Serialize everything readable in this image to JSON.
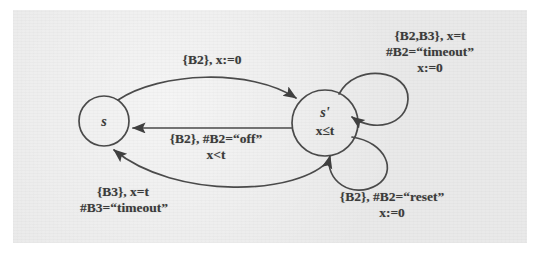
{
  "figure": {
    "kind": "timed-automaton-diagram",
    "background_color": "#e9e9e9",
    "page_color": "#ffffff",
    "ink_color": "#3b3b3b"
  },
  "states": [
    {
      "id": "s",
      "label": "s",
      "invariant": ""
    },
    {
      "id": "s2",
      "label": "s'",
      "invariant": "x≤t"
    }
  ],
  "transitions": [
    {
      "id": "t-s-to-sprime",
      "from": "s",
      "to": "s'",
      "shape": "arc-above",
      "label_lines": [
        "{B2}, x:=0"
      ]
    },
    {
      "id": "t-sprime-to-s-off",
      "from": "s'",
      "to": "s",
      "shape": "straight",
      "label_lines": [
        "{B2}, #B2=“off”",
        "x<t"
      ]
    },
    {
      "id": "t-sprime-to-s-timeout",
      "from": "s'",
      "to": "s",
      "shape": "arc-below",
      "label_lines": [
        "{B3}, x=t",
        "#B3=“timeout”"
      ]
    },
    {
      "id": "t-sprime-self-timeout",
      "from": "s'",
      "to": "s'",
      "shape": "self-loop-upper-right",
      "label_lines": [
        "{B2,B3}, x=t",
        "#B2=“timeout”",
        "x:=0"
      ]
    },
    {
      "id": "t-sprime-self-reset",
      "from": "s'",
      "to": "s'",
      "shape": "self-loop-lower-right",
      "label_lines": [
        "{B2}, #B2=“reset”",
        "x:=0"
      ]
    }
  ],
  "labels": {
    "top_left": "{B2}, x:=0",
    "middle_1": "{B2}, #B2=“off”",
    "middle_2": "x<t",
    "bottom_left_1": "{B3}, x=t",
    "bottom_left_2": "#B3=“timeout”",
    "top_right_1": "{B2,B3}, x=t",
    "top_right_2": "#B2=“timeout”",
    "top_right_3": "x:=0",
    "bottom_right_1": "{B2}, #B2=“reset”",
    "bottom_right_2": "x:=0",
    "state_s": "s",
    "state_sprime": "s'",
    "state_sprime_invariant": "x≤t"
  }
}
